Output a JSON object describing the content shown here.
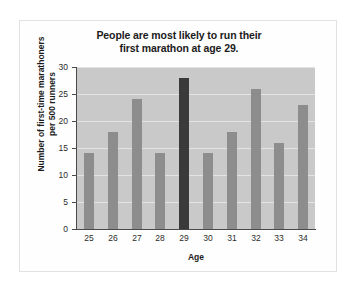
{
  "chart_data": {
    "type": "bar",
    "title": "People are most likely to run their first marathon at age 29.",
    "title_line1": "People are most likely to run their",
    "title_line2": "first marathon at age 29.",
    "xlabel": "Age",
    "ylabel": "Number of first-time marathoners per 500 runners",
    "ylabel_line1": "Number of first-time marathoners",
    "ylabel_line2": "per 500 runners",
    "categories": [
      "25",
      "26",
      "27",
      "28",
      "29",
      "30",
      "31",
      "32",
      "33",
      "34"
    ],
    "values": [
      14,
      18,
      24,
      14,
      28,
      14,
      18,
      26,
      16,
      23
    ],
    "ylim": [
      0,
      30
    ],
    "yticks": [
      "0",
      "5",
      "10",
      "15",
      "20",
      "25",
      "30"
    ],
    "ytick_values": [
      0,
      5,
      10,
      15,
      20,
      25,
      30
    ],
    "grid": true,
    "legend": "none",
    "highlight_category": "29",
    "colors": {
      "bar": "#8d8d8d",
      "bar_highlight": "#3a3a3a",
      "plot_background": "#c9c9c9",
      "gridline": "#e3e3e3",
      "axis": "#4a4a4a",
      "text": "#1b1b1b",
      "card_background": "#fefefe",
      "card_border": "#e2e2e2",
      "page_background": "#ffffff"
    }
  }
}
